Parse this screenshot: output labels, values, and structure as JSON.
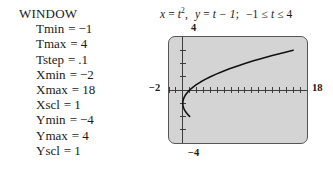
{
  "window_panel": {
    "heading": "WINDOW",
    "equals": "=",
    "rows": [
      {
        "name": "Tmin",
        "value": "−1"
      },
      {
        "name": "Tmax",
        "value": "4"
      },
      {
        "name": "Tstep",
        "value": ".1"
      },
      {
        "name": "Xmin",
        "value": "−2"
      },
      {
        "name": "Xmax",
        "value": "18"
      },
      {
        "name": "Xscl",
        "value": "1"
      },
      {
        "name": "Ymin",
        "value": "−4"
      },
      {
        "name": "Ymax",
        "value": "4"
      },
      {
        "name": "Yscl",
        "value": "1"
      }
    ]
  },
  "figure": {
    "caption": {
      "x_lhs": "x",
      "eq1": "=",
      "x_rhs_base": "t",
      "x_rhs_exp": "2",
      "comma": ",",
      "y_lhs": "y",
      "eq2": "=",
      "y_rhs": "t − 1",
      "semicolon": ";",
      "domain_lo": "−1",
      "le1": "≤",
      "param": "t",
      "le2": "≤",
      "domain_hi": "4",
      "full_text": "x = t², y = t − 1;  −1 ≤ t ≤ 4"
    },
    "axis_labels": {
      "ymax": "4",
      "xmin": "−2",
      "xmax": "18",
      "ymin": "−4"
    },
    "colors": {
      "screen_fill": "#d4d4d4",
      "screen_border": "#555555",
      "curve": "#111111",
      "axis": "#3a3a3a"
    }
  },
  "chart_data": {
    "type": "line",
    "xlabel": "",
    "ylabel": "",
    "xlim": [
      -2,
      18
    ],
    "ylim": [
      -4,
      4
    ],
    "xscl": 1,
    "yscl": 1,
    "grid": false,
    "legend": null,
    "parametric": {
      "x_of_t": "t^2",
      "y_of_t": "t - 1",
      "t_min": -1,
      "t_max": 4,
      "t_step": 0.1
    },
    "series": [
      {
        "name": "x = t², y = t − 1",
        "x": [
          1,
          0.81,
          0.64,
          0.49,
          0.36,
          0.25,
          0.16,
          0.09,
          0.04,
          0.01,
          0,
          0.01,
          0.04,
          0.09,
          0.16,
          0.25,
          0.36,
          0.49,
          0.64,
          0.81,
          1,
          1.44,
          1.96,
          2.56,
          3.24,
          4,
          4.84,
          5.76,
          6.76,
          7.84,
          9,
          10.24,
          11.56,
          12.96,
          14.44,
          16
        ],
        "y": [
          -2,
          -1.9,
          -1.8,
          -1.7,
          -1.6,
          -1.5,
          -1.4,
          -1.3,
          -1.2,
          -1.1,
          -1,
          -0.9,
          -0.8,
          -0.7,
          -0.6,
          -0.5,
          -0.4,
          -0.3,
          -0.2,
          -0.1,
          0,
          0.2,
          0.4,
          0.6,
          0.8,
          1,
          1.2,
          1.4,
          1.6,
          1.8,
          2,
          2.2,
          2.4,
          2.6,
          2.8,
          3
        ]
      }
    ]
  }
}
